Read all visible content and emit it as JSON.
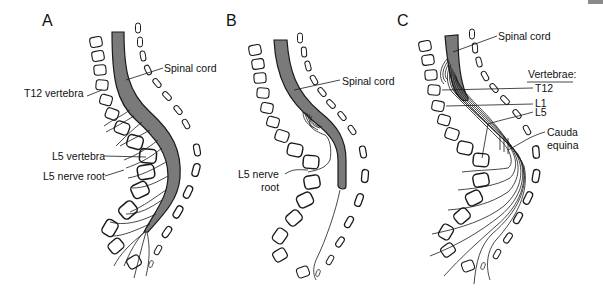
{
  "figure": {
    "type": "anatomical-diagram",
    "colors": {
      "spinal_cord_fill": "#7a7a7a",
      "line": "#1a1a1a",
      "background": "#ffffff"
    },
    "panels": [
      {
        "letter": "A",
        "labels": {
          "spinal_cord": "Spinal cord",
          "t12_vertebra": "T12 vertebra",
          "l5_vertebra": "L5 vertebra",
          "l5_nerve_root": "L5 nerve root"
        }
      },
      {
        "letter": "B",
        "labels": {
          "spinal_cord": "Spinal cord",
          "l5_nerve_root_line1": "L5 nerve",
          "l5_nerve_root_line2": "root"
        }
      },
      {
        "letter": "C",
        "labels": {
          "spinal_cord": "Spinal cord",
          "vertebrae_heading": "Vertebrae:",
          "t12": "T12",
          "l1": "L1",
          "l5": "L5",
          "cauda_equina_line1": "Cauda",
          "cauda_equina_line2": "equina"
        }
      }
    ]
  }
}
